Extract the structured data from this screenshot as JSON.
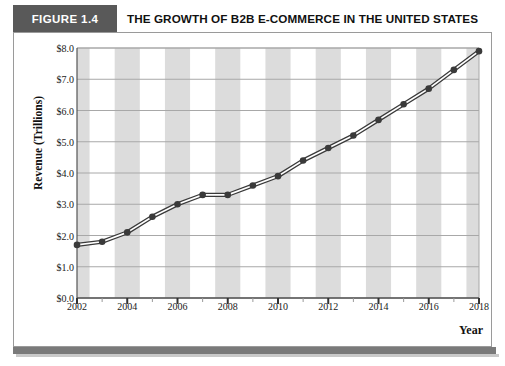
{
  "header": {
    "figure_tag": "FIGURE 1.4",
    "title": "THE GROWTH OF B2B E-COMMERCE IN THE UNITED STATES",
    "tag_bg_color": "#595959",
    "tag_text_color": "#ffffff"
  },
  "chart_data": {
    "type": "line",
    "title": "THE GROWTH OF B2B E-COMMERCE IN THE UNITED STATES",
    "xlabel": "Year",
    "ylabel": "Revenue (Trillions)",
    "x": [
      2002,
      2003,
      2004,
      2005,
      2006,
      2007,
      2008,
      2009,
      2010,
      2011,
      2012,
      2013,
      2014,
      2015,
      2016,
      2017,
      2018
    ],
    "values": [
      1.7,
      1.8,
      2.1,
      2.6,
      3.0,
      3.3,
      3.3,
      3.6,
      3.9,
      4.4,
      4.8,
      5.2,
      5.7,
      6.2,
      6.7,
      7.3,
      7.9
    ],
    "ylim": [
      0.0,
      8.0
    ],
    "xlim": [
      2002,
      2018
    ],
    "ytick_values": [
      0.0,
      1.0,
      2.0,
      3.0,
      4.0,
      5.0,
      6.0,
      7.0,
      8.0
    ],
    "ytick_labels": [
      "$0.0",
      "$1.0",
      "$2.0",
      "$3.0",
      "$4.0",
      "$5.0",
      "$6.0",
      "$7.0",
      "$8.0"
    ],
    "xtick_values": [
      2002,
      2004,
      2006,
      2008,
      2010,
      2012,
      2014,
      2016,
      2018
    ],
    "xtick_labels": [
      "2002",
      "2004",
      "2006",
      "2008",
      "2010",
      "2012",
      "2014",
      "2016",
      "2018"
    ],
    "xminor_values": [
      2003,
      2005,
      2007,
      2009,
      2011,
      2013,
      2015,
      2017
    ],
    "grid": "horizontal",
    "legend": "none",
    "band_shading": "alternating-vertical",
    "line_color": "#3a3a3a",
    "line_style": "double-stroke",
    "marker": "circle",
    "marker_color": "#3a3a3a",
    "band_color": "#dcdcdc",
    "grid_color": "#a8a8a8"
  }
}
